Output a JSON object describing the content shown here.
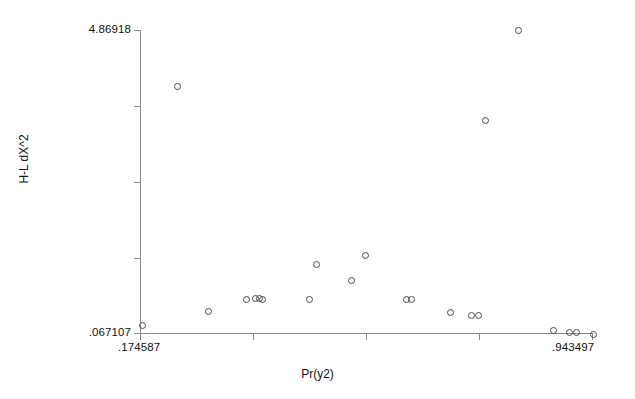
{
  "chart_data": {
    "type": "scatter",
    "title": "",
    "xlabel": "Pr(y2)",
    "ylabel": "H-L dX^2",
    "grid": false,
    "legend": null,
    "xlim": [
      0.174587,
      0.943497
    ],
    "ylim": [
      0.067107,
      4.86918
    ],
    "x_tick_labels": [
      ".174587",
      ".943497"
    ],
    "y_tick_labels": [
      "4.86918",
      ".067107"
    ],
    "x_tick_count": 5,
    "y_tick_count": 5,
    "marker": "open-circle",
    "n_points": 22,
    "points": [
      {
        "x": 0.178,
        "y": 0.106
      },
      {
        "x": 0.2395,
        "y": 3.686
      },
      {
        "x": 0.293,
        "y": 0.317
      },
      {
        "x": 0.3745,
        "y": 0.444
      },
      {
        "x": 0.393,
        "y": 0.46
      },
      {
        "x": 0.4,
        "y": 0.46
      },
      {
        "x": 0.404,
        "y": 0.444
      },
      {
        "x": 0.4985,
        "y": 0.979
      },
      {
        "x": 0.583,
        "y": 0.809
      },
      {
        "x": 0.6065,
        "y": 1.144
      },
      {
        "x": 0.6805,
        "y": 0.4755
      },
      {
        "x": 0.689,
        "y": 0.46
      },
      {
        "x": 0.75,
        "y": 0.348
      },
      {
        "x": 0.7845,
        "y": 0.317
      },
      {
        "x": 0.796,
        "y": 0.317
      },
      {
        "x": 0.774,
        "y": 2.896
      },
      {
        "x": 0.83,
        "y": 4.8692
      },
      {
        "x": 0.9,
        "y": 0.153
      },
      {
        "x": 0.9245,
        "y": 0.122
      },
      {
        "x": 0.932,
        "y": 0.122
      },
      {
        "x": 0.947,
        "y": 0.09
      },
      {
        "x": 0.493,
        "y": 0.444
      }
    ],
    "pixel_points": [
      {
        "px": 142,
        "py": 325
      },
      {
        "px": 177,
        "py": 86
      },
      {
        "px": 208,
        "py": 311
      },
      {
        "px": 246,
        "py": 299
      },
      {
        "px": 255,
        "py": 298
      },
      {
        "px": 259,
        "py": 298
      },
      {
        "px": 262,
        "py": 299
      },
      {
        "px": 316,
        "py": 264
      },
      {
        "px": 351,
        "py": 280
      },
      {
        "px": 365,
        "py": 255
      },
      {
        "px": 406,
        "py": 299
      },
      {
        "px": 411,
        "py": 299
      },
      {
        "px": 450,
        "py": 312
      },
      {
        "px": 471,
        "py": 315
      },
      {
        "px": 478,
        "py": 315
      },
      {
        "px": 485,
        "py": 120
      },
      {
        "px": 518,
        "py": 30
      },
      {
        "px": 553,
        "py": 330
      },
      {
        "px": 569,
        "py": 332
      },
      {
        "px": 576,
        "py": 332
      },
      {
        "px": 593,
        "py": 334
      },
      {
        "px": 309,
        "py": 299
      }
    ]
  },
  "axes": {
    "y_ticks_px": [
      30,
      106,
      182,
      258,
      333
    ],
    "x_ticks_px": [
      140,
      253,
      366,
      479,
      592
    ]
  }
}
